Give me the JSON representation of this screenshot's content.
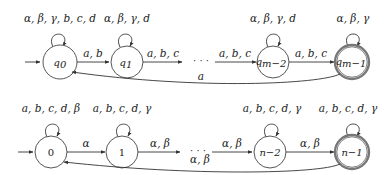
{
  "diagram": {
    "automaton_top": {
      "states": [
        {
          "id": "q0",
          "label": "q",
          "sub": "0",
          "accepting": false,
          "initial": true,
          "self_loop": "α, β, γ, b, c, d"
        },
        {
          "id": "q1",
          "label": "q",
          "sub": "1",
          "accepting": false,
          "initial": false,
          "self_loop": "α, β, γ, d"
        },
        {
          "id": "qm-2",
          "label": "q",
          "sub": "m−2",
          "accepting": false,
          "initial": false,
          "self_loop": "α, β, γ, d"
        },
        {
          "id": "qm-1",
          "label": "q",
          "sub": "m−1",
          "accepting": true,
          "initial": false,
          "self_loop": "α, β, γ"
        }
      ],
      "transitions": [
        {
          "from": "q0",
          "to": "q1",
          "label": "a, b"
        },
        {
          "from": "q1",
          "to": "…",
          "label": "a, b, c"
        },
        {
          "from": "…",
          "to": "qm-2",
          "label": "a, b, c"
        },
        {
          "from": "qm-2",
          "to": "qm-1",
          "label": "a, b, c"
        },
        {
          "from": "qm-1",
          "to": "q0",
          "label": "a"
        }
      ],
      "ellipsis": "· · ·"
    },
    "automaton_bottom": {
      "states": [
        {
          "id": "0",
          "label": "0",
          "accepting": false,
          "initial": true,
          "self_loop": "a, b, c, d, β"
        },
        {
          "id": "1",
          "label": "1",
          "accepting": false,
          "initial": false,
          "self_loop": "a, b, c, d, γ"
        },
        {
          "id": "n-2",
          "label": "n−2",
          "accepting": false,
          "initial": false,
          "self_loop": "a, b, c, d, γ"
        },
        {
          "id": "n-1",
          "label": "n−1",
          "accepting": true,
          "initial": false,
          "self_loop": "a, b, c, d, γ"
        }
      ],
      "transitions": [
        {
          "from": "0",
          "to": "1",
          "label": "α"
        },
        {
          "from": "1",
          "to": "…",
          "label": "α, β"
        },
        {
          "from": "…",
          "to": "n-2",
          "label": "α, β"
        },
        {
          "from": "n-2",
          "to": "n-1",
          "label": "α, β"
        },
        {
          "from": "n-1",
          "to": "0",
          "label": "α, β"
        }
      ],
      "ellipsis": "· · ·"
    }
  }
}
